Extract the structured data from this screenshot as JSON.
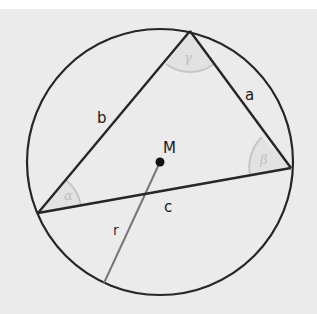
{
  "diagram": {
    "sides": {
      "a": "a",
      "b": "b",
      "c": "c"
    },
    "angles": {
      "alpha": "α",
      "beta": "β",
      "gamma": "γ"
    },
    "center_label": "M",
    "radius_label": "r",
    "colors": {
      "background": "#ebebeb",
      "stroke": "#262626",
      "radius_stroke": "#777777",
      "angle_arc": "#c4c4c4",
      "angle_fill": "#e0e0e0"
    }
  }
}
